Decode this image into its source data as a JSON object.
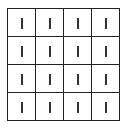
{
  "board": {
    "rows": 4,
    "cols": 4,
    "line_color": "#222222",
    "cells": [
      [
        "|",
        "|",
        "|",
        "|"
      ],
      [
        "|",
        "|",
        "|",
        "|"
      ],
      [
        "|",
        "|",
        "|",
        "|"
      ],
      [
        "|",
        "|",
        "|",
        "|"
      ]
    ]
  }
}
